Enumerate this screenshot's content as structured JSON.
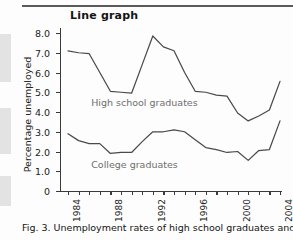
{
  "figure": {
    "title": "Line graph",
    "caption": "Fig. 3. Unemployment rates of high school graduates and college"
  },
  "chart_data": {
    "type": "line",
    "title": "Line graph",
    "xlabel": "",
    "ylabel": "Percentage unemployed",
    "xlim": [
      1984,
      2004
    ],
    "ylim": [
      0,
      8
    ],
    "grid": false,
    "legend_position": "inline-annotation",
    "ytick_labels": [
      "8.0",
      "7.0",
      "6.0",
      "5.0",
      "4.0",
      "3.0",
      "2.0",
      "1.0",
      "0"
    ],
    "ytick_values": [
      8,
      7,
      6,
      5,
      4,
      3,
      2,
      1,
      0
    ],
    "xtick_values": [
      1984,
      1985,
      1986,
      1987,
      1988,
      1989,
      1990,
      1991,
      1992,
      1993,
      1994,
      1995,
      1996,
      1997,
      1998,
      1999,
      2000,
      2001,
      2002,
      2003,
      2004
    ],
    "xtick_labels": [
      "1984",
      "",
      "",
      "",
      "1988",
      "",
      "",
      "",
      "1992",
      "",
      "",
      "",
      "1996",
      "",
      "",
      "",
      "2000",
      "",
      "",
      "",
      "2004"
    ],
    "x": [
      1984,
      1985,
      1986,
      1987,
      1988,
      1989,
      1990,
      1991,
      1992,
      1993,
      1994,
      1995,
      1996,
      1997,
      1998,
      1999,
      2000,
      2001,
      2002,
      2003,
      2004
    ],
    "series": [
      {
        "name": "High school graduates",
        "values": [
          7.1,
          7.0,
          6.95,
          6.0,
          5.05,
          5.0,
          4.95,
          6.4,
          7.85,
          7.3,
          7.1,
          6.0,
          5.05,
          5.0,
          4.85,
          4.8,
          3.95,
          3.55,
          3.8,
          4.1,
          5.55
        ]
      },
      {
        "name": "College graduates",
        "values": [
          2.9,
          2.55,
          2.4,
          2.4,
          1.9,
          1.95,
          1.95,
          2.5,
          3.0,
          3.0,
          3.1,
          3.0,
          2.6,
          2.2,
          2.1,
          1.95,
          2.0,
          1.55,
          2.05,
          2.1,
          3.55
        ]
      }
    ],
    "annotations": [
      {
        "text": "High school graduates",
        "x": 1986,
        "y": 4.45
      },
      {
        "text": "College graduates",
        "x": 1986,
        "y": 1.3
      }
    ]
  }
}
